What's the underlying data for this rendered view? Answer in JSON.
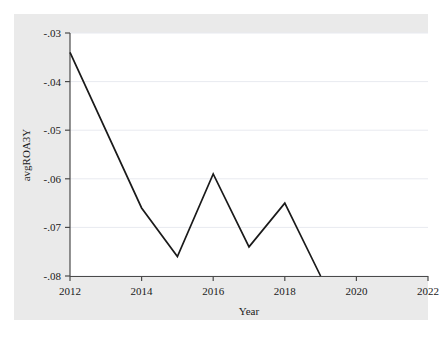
{
  "figure": {
    "background_color": "#eaeaea",
    "plot_background_color": "#ffffff",
    "line_color": "#1a1a1a",
    "grid_color": "#e8eaf0",
    "axis_color": "#4a4a4a"
  },
  "chart_data": {
    "type": "line",
    "title": "",
    "xlabel": "Year",
    "ylabel": "avgROA3Y",
    "xlim": [
      2012,
      2022
    ],
    "ylim": [
      -0.08,
      -0.03
    ],
    "grid": true,
    "legend": null,
    "x_ticks": [
      "2012",
      "2014",
      "2016",
      "2018",
      "2020",
      "2022"
    ],
    "x_tick_values": [
      2012,
      2014,
      2016,
      2018,
      2020,
      2022
    ],
    "y_ticks": [
      "-.03",
      "-.04",
      "-.05",
      "-.06",
      "-.07",
      "-.08"
    ],
    "y_tick_values": [
      -0.03,
      -0.04,
      -0.05,
      -0.06,
      -0.07,
      -0.08
    ],
    "x": [
      2012,
      2014,
      2015,
      2016,
      2017,
      2018,
      2019
    ],
    "values": [
      -0.034,
      -0.066,
      -0.076,
      -0.059,
      -0.074,
      -0.065,
      -0.08
    ],
    "series": [
      {
        "name": "avgROA3Y",
        "x": [
          2012,
          2014,
          2015,
          2016,
          2017,
          2018,
          2019
        ],
        "values": [
          -0.034,
          -0.066,
          -0.076,
          -0.059,
          -0.074,
          -0.065,
          -0.08
        ]
      }
    ]
  }
}
